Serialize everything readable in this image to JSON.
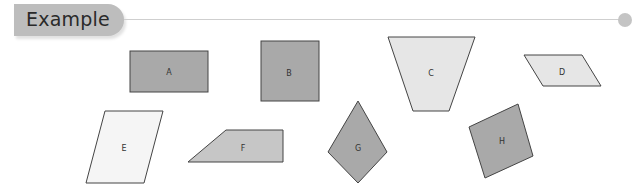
{
  "header": {
    "title": "Example"
  },
  "colors": {
    "dark": "#a9a9a9",
    "light": "#e6e6e6",
    "lighter": "#f5f5f5",
    "stroke": "#444444",
    "tab": "#bdbdbd"
  },
  "shapes": [
    {
      "label": "A",
      "type": "rectangle",
      "fill": "dark"
    },
    {
      "label": "B",
      "type": "square",
      "fill": "dark"
    },
    {
      "label": "C",
      "type": "trapezoid",
      "fill": "light"
    },
    {
      "label": "D",
      "type": "parallelogram",
      "fill": "light"
    },
    {
      "label": "E",
      "type": "parallelogram",
      "fill": "lighter"
    },
    {
      "label": "F",
      "type": "trapezoid",
      "fill": "mid"
    },
    {
      "label": "G",
      "type": "kite",
      "fill": "dark"
    },
    {
      "label": "H",
      "type": "square-rotated",
      "fill": "dark"
    }
  ]
}
